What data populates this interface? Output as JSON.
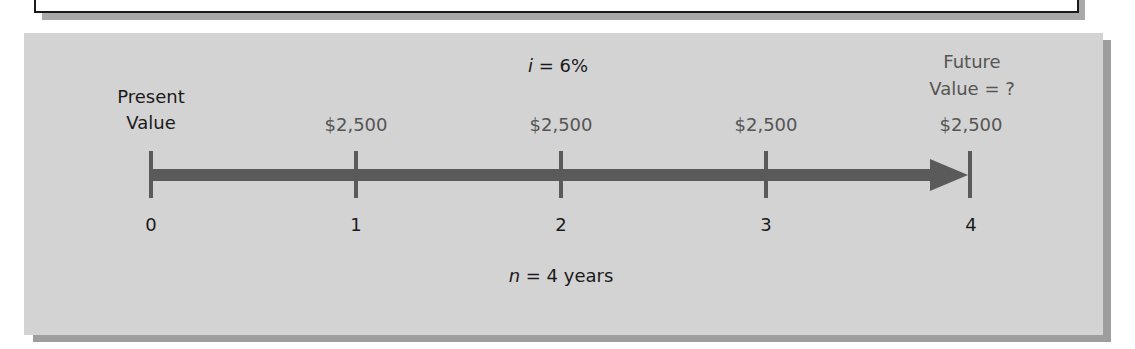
{
  "diagram": {
    "type": "timeline",
    "title": "",
    "rate_label": "i = 6%",
    "rate_var": "i",
    "rate_value": "= 6%",
    "period_label": "n = 4 years",
    "period_var": "n",
    "period_value": "= 4 years",
    "present_value": {
      "line1": "Present",
      "line2": "Value"
    },
    "future_value": {
      "line1": "Future",
      "line2": "Value = ?"
    },
    "points": [
      {
        "period": "0",
        "amount": ""
      },
      {
        "period": "1",
        "amount": "$2,500"
      },
      {
        "period": "2",
        "amount": "$2,500"
      },
      {
        "period": "3",
        "amount": "$2,500"
      },
      {
        "period": "4",
        "amount": "$2,500"
      }
    ],
    "colors": {
      "panel_background": "#d3d3d3",
      "panel_shadow": "#9e9e9e",
      "timeline_bar": "#5a5a5a",
      "primary_text": "#1a1a1a",
      "secondary_text": "#555555"
    }
  }
}
